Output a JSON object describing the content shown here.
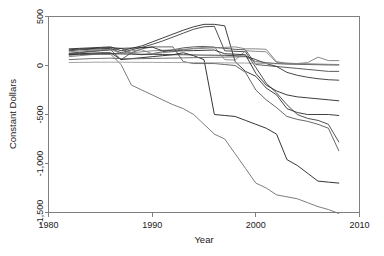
{
  "chart_data": {
    "type": "line",
    "title": "",
    "xlabel": "Year",
    "ylabel": "Constant Dollars",
    "xlim": [
      1980,
      2010
    ],
    "ylim": [
      -1500,
      500
    ],
    "xticks": [
      1980,
      1990,
      2000,
      2010
    ],
    "xtick_labels": [
      "1980",
      "1990",
      "2000",
      "2010"
    ],
    "yticks": [
      500,
      0,
      -500,
      -1000,
      -1500
    ],
    "ytick_labels": [
      "500",
      "0",
      "-500",
      "-1,000",
      "-1,500"
    ],
    "grid": false,
    "legend": "none",
    "x": [
      1982,
      1983,
      1984,
      1985,
      1986,
      1987,
      1988,
      1989,
      1990,
      1991,
      1992,
      1993,
      1994,
      1995,
      1996,
      1997,
      1998,
      1999,
      2000,
      2001,
      2002,
      2003,
      2004,
      2005,
      2006,
      2007,
      2008
    ],
    "series": [
      {
        "name": "series-1",
        "color": "#2b2b2b",
        "values": [
          170,
          175,
          180,
          185,
          190,
          150,
          175,
          200,
          240,
          280,
          320,
          360,
          395,
          420,
          420,
          405,
          40,
          -60,
          -110,
          -230,
          -300,
          -440,
          -480,
          -500,
          -500,
          -500,
          -510
        ]
      },
      {
        "name": "series-2",
        "color": "#3d3d3d",
        "values": [
          150,
          160,
          165,
          170,
          175,
          130,
          160,
          185,
          215,
          250,
          290,
          330,
          370,
          395,
          400,
          150,
          145,
          140,
          -20,
          -180,
          -280,
          -400,
          -500,
          -540,
          -560,
          -600,
          -780
        ]
      },
      {
        "name": "series-3",
        "color": "#555555",
        "values": [
          120,
          130,
          140,
          150,
          160,
          60,
          130,
          170,
          190,
          190,
          190,
          40,
          20,
          20,
          20,
          10,
          0,
          -70,
          -250,
          -350,
          -430,
          -520,
          -550,
          -570,
          -600,
          -640,
          -870
        ]
      },
      {
        "name": "series-4",
        "color": "#1f1f1f",
        "values": [
          115,
          120,
          125,
          130,
          130,
          60,
          70,
          80,
          90,
          100,
          110,
          130,
          100,
          60,
          -500,
          -510,
          -520,
          -560,
          -600,
          -640,
          -700,
          -960,
          -1020,
          -1100,
          -1180,
          -1190,
          -1200
        ]
      },
      {
        "name": "series-5",
        "color": "#6e6e6e",
        "values": [
          105,
          110,
          112,
          115,
          115,
          10,
          -200,
          -250,
          -300,
          -350,
          -400,
          -440,
          -500,
          -600,
          -700,
          -750,
          -900,
          -1050,
          -1200,
          -1250,
          -1320,
          -1340,
          -1360,
          -1400,
          -1440,
          -1470,
          -1510
        ]
      },
      {
        "name": "series-6",
        "color": "#4a4a4a",
        "values": [
          125,
          135,
          145,
          155,
          160,
          175,
          120,
          110,
          120,
          140,
          160,
          180,
          190,
          195,
          185,
          175,
          165,
          160,
          10,
          0,
          -10,
          -20,
          -30,
          -40,
          -50,
          -60,
          -60
        ]
      },
      {
        "name": "series-7",
        "color": "#7a7a7a",
        "values": [
          90,
          100,
          110,
          118,
          120,
          125,
          130,
          140,
          150,
          155,
          160,
          165,
          170,
          175,
          180,
          185,
          190,
          170,
          170,
          165,
          40,
          20,
          20,
          30,
          85,
          50,
          50
        ]
      },
      {
        "name": "series-8",
        "color": "#333333",
        "values": [
          110,
          115,
          118,
          120,
          120,
          118,
          116,
          115,
          114,
          112,
          110,
          110,
          108,
          106,
          105,
          104,
          100,
          95,
          60,
          20,
          -10,
          -70,
          -100,
          -120,
          -135,
          -145,
          -150
        ]
      },
      {
        "name": "series-9",
        "color": "#9a9a9a",
        "values": [
          30,
          32,
          33,
          34,
          34,
          34,
          33,
          32,
          32,
          31,
          30,
          30,
          29,
          28,
          28,
          27,
          26,
          25,
          22,
          20,
          18,
          16,
          14,
          12,
          10,
          8,
          8
        ]
      },
      {
        "name": "series-10",
        "color": "#5f5f5f",
        "values": [
          60,
          65,
          70,
          72,
          75,
          70,
          68,
          70,
          72,
          74,
          76,
          78,
          80,
          82,
          84,
          86,
          88,
          90,
          40,
          30,
          20,
          15,
          12,
          10,
          8,
          6,
          5
        ]
      },
      {
        "name": "series-11",
        "color": "#808080",
        "values": [
          140,
          148,
          155,
          160,
          165,
          120,
          150,
          160,
          120,
          130,
          140,
          160,
          175,
          185,
          190,
          60,
          55,
          150,
          145,
          140,
          30,
          25,
          20,
          18,
          15,
          12,
          10
        ]
      },
      {
        "name": "series-12",
        "color": "#262626",
        "values": [
          160,
          168,
          172,
          178,
          182,
          175,
          178,
          182,
          188,
          150,
          148,
          150,
          152,
          155,
          158,
          120,
          115,
          110,
          -80,
          -200,
          -260,
          -300,
          -320,
          -330,
          -340,
          -350,
          -360
        ]
      }
    ]
  },
  "axes": {
    "ylabel": "Constant Dollars",
    "xlabel": "Year"
  }
}
